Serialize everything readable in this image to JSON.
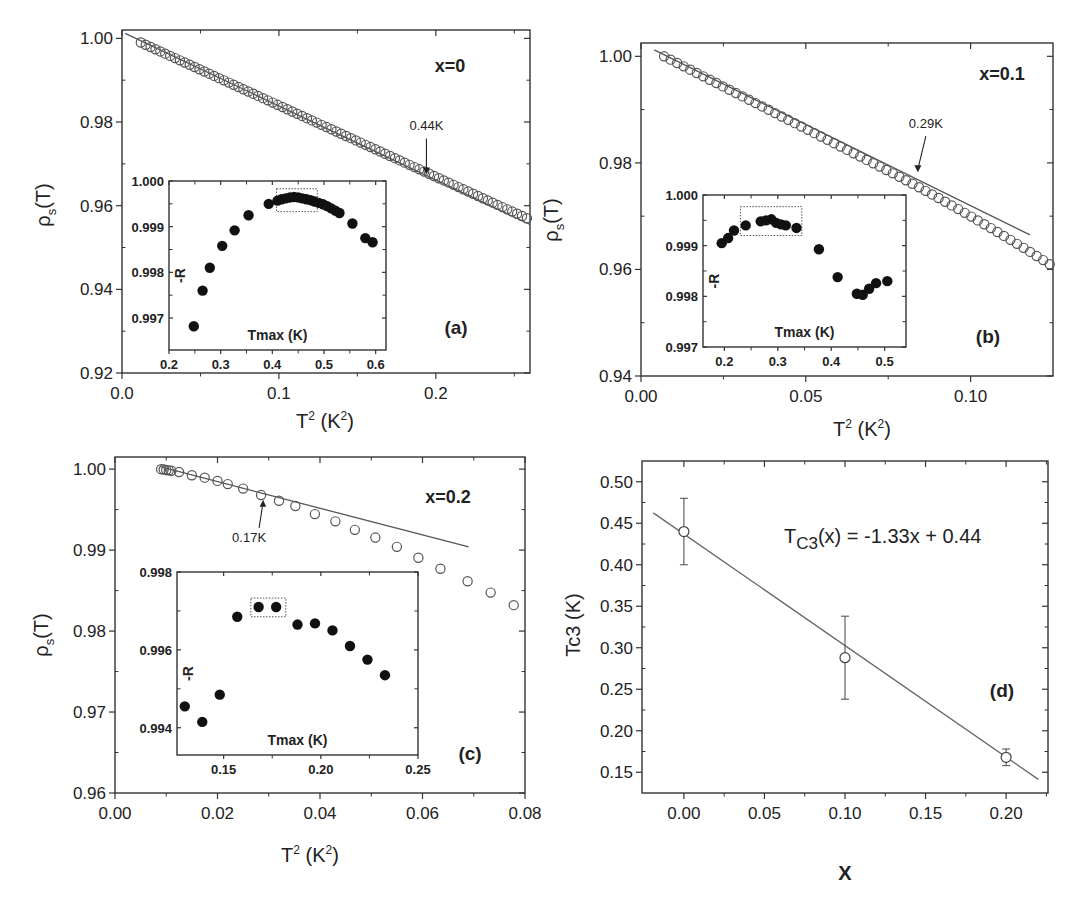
{
  "figure": {
    "panels": [
      "a",
      "b",
      "c",
      "d"
    ]
  },
  "chart_data": [
    {
      "id": "a",
      "type": "scatter",
      "panel_label": "(a)",
      "series_label": "x=0",
      "xlabel": "T² (K²)",
      "ylabel": "ρs(T)",
      "xlim": [
        0.0,
        0.26
      ],
      "ylim": [
        0.92,
        1.002
      ],
      "xticks": [
        0.0,
        0.1,
        0.2
      ],
      "xtick_labels": [
        "0.0",
        "0.1",
        "0.2"
      ],
      "yticks": [
        0.92,
        0.94,
        0.96,
        0.98,
        1.0
      ],
      "ytick_labels": [
        "0.92",
        "0.94",
        "0.96",
        "0.98",
        "1.00"
      ],
      "fit_line": {
        "x": [
          0.002,
          0.26
        ],
        "y": [
          1.0012,
          0.9555
        ]
      },
      "data_range": {
        "x_start": 0.012,
        "x_end": 0.258,
        "y_start": 0.999,
        "y_end": 0.957,
        "n": 80,
        "curvature": 0.0
      },
      "annotation": {
        "text": "0.44K",
        "x": 0.194,
        "y": 0.9665
      },
      "inset": {
        "xlabel": "Tmax (K)",
        "ylabel": "-R",
        "xlim": [
          0.2,
          0.62
        ],
        "ylim": [
          0.9963,
          1.0
        ],
        "xticks": [
          0.2,
          0.3,
          0.4,
          0.5,
          0.6
        ],
        "xtick_labels": [
          "0.2",
          "0.3",
          "0.4",
          "0.5",
          "0.6"
        ],
        "yticks": [
          0.997,
          0.998,
          0.999,
          1.0
        ],
        "ytick_labels": [
          "0.997",
          "0.998",
          "0.999",
          "1.000"
        ],
        "x": [
          0.248,
          0.265,
          0.279,
          0.303,
          0.327,
          0.354,
          0.393,
          0.41,
          0.418,
          0.426,
          0.434,
          0.442,
          0.45,
          0.458,
          0.466,
          0.474,
          0.482,
          0.49,
          0.498,
          0.506,
          0.514,
          0.522,
          0.53,
          0.555,
          0.58,
          0.594
        ],
        "y": [
          0.99682,
          0.9976,
          0.9981,
          0.99858,
          0.99892,
          0.99925,
          0.9995,
          0.99957,
          0.9996,
          0.99962,
          0.99964,
          0.99965,
          0.99964,
          0.99962,
          0.9996,
          0.99958,
          0.99955,
          0.99952,
          0.99949,
          0.99945,
          0.9994,
          0.99935,
          0.9993,
          0.99907,
          0.99875,
          0.99866
        ],
        "box": {
          "x0": 0.408,
          "x1": 0.487,
          "y0": 0.99933,
          "y1": 0.99983
        }
      }
    },
    {
      "id": "b",
      "type": "scatter",
      "panel_label": "(b)",
      "series_label": "x=0.1",
      "xlabel": "T² (K²)",
      "ylabel": "ρs(T)",
      "xlim": [
        0.0,
        0.125
      ],
      "ylim": [
        0.94,
        1.0025
      ],
      "xticks": [
        0.0,
        0.05,
        0.1
      ],
      "xtick_labels": [
        "0.00",
        "0.05",
        "0.10"
      ],
      "yticks": [
        0.94,
        0.96,
        0.98,
        1.0
      ],
      "ytick_labels": [
        "0.94",
        "0.96",
        "0.98",
        "1.00"
      ],
      "fit_line": {
        "x": [
          0.004,
          0.118
        ],
        "y": [
          1.0012,
          0.9665
        ]
      },
      "data_range": {
        "x_start": 0.007,
        "x_end": 0.124,
        "y_start": 1.0,
        "y_end": 0.963,
        "n": 60,
        "curvature": 0.0025
      },
      "annotation": {
        "text": "0.29K",
        "x": 0.084,
        "y": 0.9775
      },
      "inset": {
        "xlabel": "Tmax (K)",
        "ylabel": "-R",
        "xlim": [
          0.16,
          0.54
        ],
        "ylim": [
          0.997,
          1.0
        ],
        "xticks": [
          0.2,
          0.3,
          0.4,
          0.5
        ],
        "xtick_labels": [
          "0.2",
          "0.3",
          "0.4",
          "0.5"
        ],
        "yticks": [
          0.997,
          0.998,
          0.999,
          1.0
        ],
        "ytick_labels": [
          "0.997",
          "0.998",
          "0.999",
          "1.000"
        ],
        "x": [
          0.195,
          0.207,
          0.218,
          0.24,
          0.268,
          0.278,
          0.288,
          0.297,
          0.306,
          0.315,
          0.335,
          0.377,
          0.412,
          0.448,
          0.459,
          0.471,
          0.484,
          0.505
        ],
        "y": [
          0.99905,
          0.99915,
          0.9993,
          0.9994,
          0.99948,
          0.9995,
          0.99952,
          0.99945,
          0.99942,
          0.9994,
          0.99935,
          0.99893,
          0.99838,
          0.99805,
          0.99803,
          0.99815,
          0.99826,
          0.9983
        ],
        "box": {
          "x0": 0.23,
          "x1": 0.345,
          "y0": 0.9992,
          "y1": 0.99977
        }
      }
    },
    {
      "id": "c",
      "type": "scatter",
      "panel_label": "(c)",
      "series_label": "x=0.2",
      "xlabel": "T² (K²)",
      "ylabel": "ρs(T)",
      "xlim": [
        0.0,
        0.08
      ],
      "ylim": [
        0.96,
        1.0015
      ],
      "xticks": [
        0.0,
        0.02,
        0.04,
        0.06,
        0.08
      ],
      "xtick_labels": [
        "0.00",
        "0.02",
        "0.04",
        "0.06",
        "0.08"
      ],
      "yticks": [
        0.96,
        0.97,
        0.98,
        0.99,
        1.0
      ],
      "ytick_labels": [
        "0.96",
        "0.97",
        "0.98",
        "0.99",
        "1.00"
      ],
      "fit_line": {
        "x": [
          0.0088,
          0.069
        ],
        "y": [
          1.0003,
          0.9904
        ]
      },
      "points": {
        "x": [
          0.009,
          0.0095,
          0.01,
          0.0105,
          0.011,
          0.0125,
          0.015,
          0.0175,
          0.02,
          0.022,
          0.025,
          0.0285,
          0.032,
          0.0352,
          0.039,
          0.043,
          0.0468,
          0.0508,
          0.055,
          0.0592,
          0.0635,
          0.0688,
          0.0733,
          0.0778
        ],
        "y": [
          1.0,
          0.99995,
          0.9999,
          0.99985,
          0.9998,
          0.99965,
          0.99925,
          0.99895,
          0.99855,
          0.99815,
          0.9976,
          0.9968,
          0.9961,
          0.99545,
          0.99445,
          0.99355,
          0.9925,
          0.99155,
          0.9904,
          0.98905,
          0.9877,
          0.98615,
          0.98475,
          0.9832
        ]
      },
      "annotation": {
        "text": "0.17K",
        "x": 0.0289,
        "y": 0.9967
      },
      "inset": {
        "xlabel": "Tmax (K)",
        "ylabel": "-R",
        "xlim": [
          0.126,
          0.25
        ],
        "ylim": [
          0.9933,
          0.998
        ],
        "xticks": [
          0.15,
          0.2,
          0.25
        ],
        "xtick_labels": [
          "0.15",
          "0.20",
          "0.25"
        ],
        "yticks": [
          0.994,
          0.996,
          0.998
        ],
        "ytick_labels": [
          "0.994",
          "0.996",
          "0.998"
        ],
        "x": [
          0.13,
          0.139,
          0.148,
          0.157,
          0.168,
          0.177,
          0.188,
          0.197,
          0.206,
          0.215,
          0.224,
          0.233
        ],
        "y": [
          0.99455,
          0.99415,
          0.99485,
          0.99685,
          0.9971,
          0.9971,
          0.99665,
          0.99668,
          0.9965,
          0.9961,
          0.99575,
          0.99535
        ],
        "box": {
          "x0": 0.164,
          "x1": 0.182,
          "y0": 0.99685,
          "y1": 0.99733
        }
      }
    },
    {
      "id": "d",
      "type": "scatter",
      "panel_label": "(d)",
      "equation": "Tc3(x) = -1.33x + 0.44",
      "equation_main": "T",
      "equation_sub": "C3",
      "equation_rest": "(x) = -1.33x + 0.44",
      "xlabel": "X",
      "ylabel": "Tc3 (K)",
      "xlim": [
        -0.026,
        0.226
      ],
      "ylim": [
        0.125,
        0.525
      ],
      "xticks": [
        0.0,
        0.05,
        0.1,
        0.15,
        0.2
      ],
      "xtick_labels": [
        "0.00",
        "0.05",
        "0.10",
        "0.15",
        "0.20"
      ],
      "yticks": [
        0.15,
        0.2,
        0.25,
        0.3,
        0.35,
        0.4,
        0.45,
        0.5
      ],
      "ytick_labels": [
        "0.15",
        "0.20",
        "0.25",
        "0.30",
        "0.35",
        "0.40",
        "0.45",
        "0.50"
      ],
      "x": [
        0.0,
        0.1,
        0.2
      ],
      "y": [
        0.44,
        0.288,
        0.168
      ],
      "err_low": [
        0.4,
        0.238,
        0.158
      ],
      "err_high": [
        0.48,
        0.338,
        0.178
      ],
      "fit_line": {
        "x": [
          -0.019,
          0.22
        ],
        "y": [
          0.4625,
          0.1414
        ]
      }
    }
  ]
}
